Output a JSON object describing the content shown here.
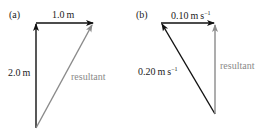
{
  "panels": [
    {
      "id": "a",
      "tag": "(a)",
      "vectors": [
        {
          "role": "component",
          "label": "2.0 m",
          "direction": "up",
          "color": "#111111"
        },
        {
          "role": "component",
          "label": "1.0 m",
          "direction": "right",
          "color": "#111111"
        },
        {
          "role": "resultant",
          "label": "resultant",
          "direction": "up-right",
          "color": "#8a8a8a"
        }
      ]
    },
    {
      "id": "b",
      "tag": "(b)",
      "vectors": [
        {
          "role": "component",
          "label_main": "0.20 m s",
          "label_sup": "−1",
          "direction": "up-left",
          "color": "#111111"
        },
        {
          "role": "component",
          "label_main": "0.10 m s",
          "label_sup": "−1",
          "direction": "right",
          "color": "#111111"
        },
        {
          "role": "resultant",
          "label": "resultant",
          "direction": "up",
          "color": "#8a8a8a"
        }
      ]
    }
  ]
}
